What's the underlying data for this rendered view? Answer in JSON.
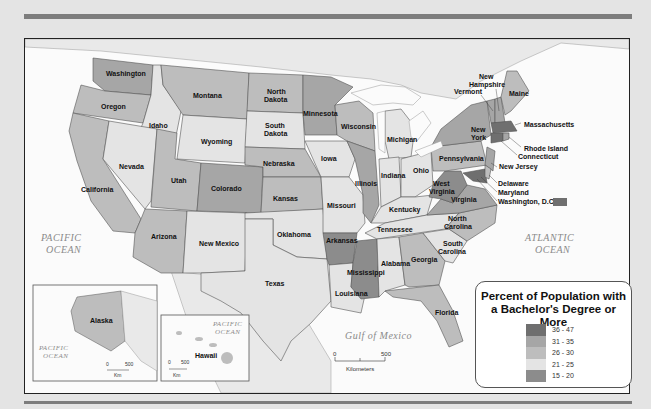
{
  "map": {
    "title": "Percent of Population with a Bachelor's Degree or More",
    "legend": {
      "title_line1": "Percent of Population with",
      "title_line2": "a Bachelor's Degree or More",
      "classes": [
        {
          "label": "36 - 47",
          "color": "#6f6f6f"
        },
        {
          "label": "31 - 35",
          "color": "#a6a6a6"
        },
        {
          "label": "26 - 30",
          "color": "#bdbdbd"
        },
        {
          "label": "21 - 25",
          "color": "#e4e4e4"
        },
        {
          "label": "15 - 20",
          "color": "#8c8c8c"
        }
      ]
    },
    "states": [
      {
        "name": "Washington",
        "class": "31 - 35"
      },
      {
        "name": "Oregon",
        "class": "26 - 30"
      },
      {
        "name": "California",
        "class": "26 - 30"
      },
      {
        "name": "Idaho",
        "class": "21 - 25"
      },
      {
        "name": "Nevada",
        "class": "21 - 25"
      },
      {
        "name": "Montana",
        "class": "26 - 30"
      },
      {
        "name": "Wyoming",
        "class": "21 - 25"
      },
      {
        "name": "Utah",
        "class": "26 - 30"
      },
      {
        "name": "Colorado",
        "class": "31 - 35"
      },
      {
        "name": "Arizona",
        "class": "26 - 30"
      },
      {
        "name": "New Mexico",
        "class": "21 - 25"
      },
      {
        "name": "North Dakota",
        "class": "26 - 30"
      },
      {
        "name": "South Dakota",
        "class": "21 - 25"
      },
      {
        "name": "Nebraska",
        "class": "26 - 30"
      },
      {
        "name": "Kansas",
        "class": "26 - 30"
      },
      {
        "name": "Oklahoma",
        "class": "21 - 25"
      },
      {
        "name": "Texas",
        "class": "21 - 25"
      },
      {
        "name": "Minnesota",
        "class": "31 - 35"
      },
      {
        "name": "Iowa",
        "class": "21 - 25"
      },
      {
        "name": "Missouri",
        "class": "21 - 25"
      },
      {
        "name": "Arkansas",
        "class": "15 - 20"
      },
      {
        "name": "Louisiana",
        "class": "21 - 25"
      },
      {
        "name": "Wisconsin",
        "class": "26 - 30"
      },
      {
        "name": "Illinois",
        "class": "31 - 35"
      },
      {
        "name": "Mississippi",
        "class": "15 - 20"
      },
      {
        "name": "Michigan",
        "class": "21 - 25"
      },
      {
        "name": "Indiana",
        "class": "21 - 25"
      },
      {
        "name": "Kentucky",
        "class": "21 - 25"
      },
      {
        "name": "Tennessee",
        "class": "21 - 25"
      },
      {
        "name": "Alabama",
        "class": "21 - 25"
      },
      {
        "name": "Ohio",
        "class": "21 - 25"
      },
      {
        "name": "Georgia",
        "class": "26 - 30"
      },
      {
        "name": "Florida",
        "class": "26 - 30"
      },
      {
        "name": "South Carolina",
        "class": "21 - 25"
      },
      {
        "name": "North Carolina",
        "class": "26 - 30"
      },
      {
        "name": "Virginia",
        "class": "31 - 35"
      },
      {
        "name": "West Virginia",
        "class": "15 - 20"
      },
      {
        "name": "Pennsylvania",
        "class": "26 - 30"
      },
      {
        "name": "New York",
        "class": "31 - 35"
      },
      {
        "name": "Vermont",
        "class": "31 - 35"
      },
      {
        "name": "New Hampshire",
        "class": "31 - 35"
      },
      {
        "name": "Maine",
        "class": "26 - 30"
      },
      {
        "name": "Massachusetts",
        "class": "36 - 47"
      },
      {
        "name": "Rhode Island",
        "class": "31 - 35"
      },
      {
        "name": "Connecticut",
        "class": "36 - 47"
      },
      {
        "name": "New Jersey",
        "class": "31 - 35"
      },
      {
        "name": "Delaware",
        "class": "26 - 30"
      },
      {
        "name": "Maryland",
        "class": "36 - 47"
      },
      {
        "name": "Washington, D.C.",
        "class": "36 - 47"
      },
      {
        "name": "Alaska",
        "class": "26 - 30"
      },
      {
        "name": "Hawaii",
        "class": "26 - 30"
      }
    ],
    "water_labels": {
      "pacific_line1": "PACIFIC",
      "pacific_line2": "OCEAN",
      "atlantic_line1": "ATLANTIC",
      "atlantic_line2": "OCEAN",
      "gulf": "Gulf of Mexico"
    },
    "scale": {
      "zero": "0",
      "max": "500",
      "unit": "Kilometers"
    },
    "alaska_inset": {
      "label": "Alaska",
      "ocean1": "PACIFIC",
      "ocean2": "OCEAN",
      "zero": "0",
      "max": "500",
      "unit": "Km"
    },
    "hawaii_inset": {
      "label": "Hawaii",
      "ocean1": "PACIFIC",
      "ocean2": "OCEAN",
      "zero": "0",
      "max": "500",
      "unit": "Km"
    }
  },
  "labels": {
    "washington": "Washington",
    "oregon": "Oregon",
    "california": "California",
    "idaho": "Idaho",
    "nevada": "Nevada",
    "montana": "Montana",
    "wyoming": "Wyoming",
    "utah": "Utah",
    "colorado": "Colorado",
    "arizona": "Arizona",
    "new_mexico": "New Mexico",
    "north": "North",
    "dakota": "Dakota",
    "south": "South",
    "nebraska": "Nebraska",
    "kansas": "Kansas",
    "oklahoma": "Oklahoma",
    "texas": "Texas",
    "minnesota": "Minnesota",
    "iowa": "Iowa",
    "missouri": "Missouri",
    "arkansas": "Arkansas",
    "louisiana": "Louisiana",
    "wisconsin": "Wisconsin",
    "illinois": "Illinois",
    "mississippi": "Mississippi",
    "michigan": "Michigan",
    "indiana": "Indiana",
    "kentucky": "Kentucky",
    "tennessee": "Tennessee",
    "alabama": "Alabama",
    "ohio": "Ohio",
    "georgia": "Georgia",
    "florida": "Florida",
    "carolina": "Carolina",
    "virginia": "Virginia",
    "west": "West",
    "pennsylvania": "Pennsylvania",
    "new": "New",
    "york": "York",
    "vermont": "Vermont",
    "hampshire": "Hampshire",
    "maine": "Maine",
    "massachusetts": "Massachusetts",
    "rhode_island": "Rhode Island",
    "connecticut": "Connecticut",
    "new_jersey": "New Jersey",
    "delaware": "Delaware",
    "maryland": "Maryland",
    "dc": "Washington, D.C."
  }
}
